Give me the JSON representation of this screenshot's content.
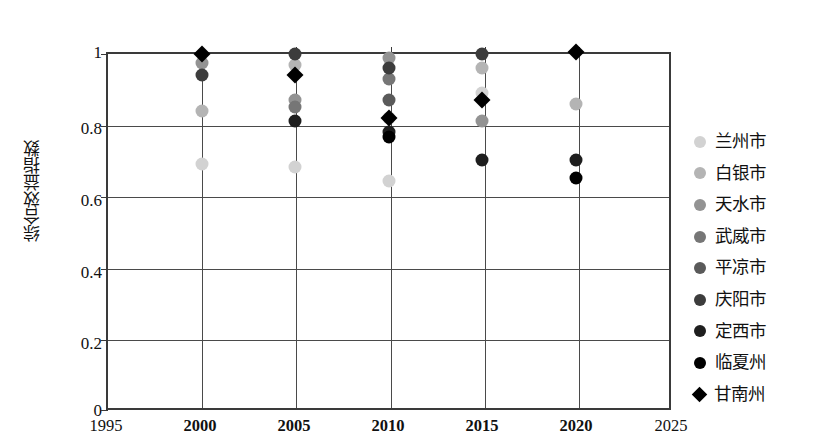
{
  "chart_data": {
    "type": "scatter",
    "title": "",
    "xlabel": "",
    "ylabel": "综合效益指数",
    "xlim": [
      1995,
      2025
    ],
    "ylim": [
      0,
      1
    ],
    "xticks": [
      1995,
      2000,
      2005,
      2010,
      2015,
      2020,
      2025
    ],
    "xticklabels": [
      "1995",
      "2000",
      "2005",
      "2010",
      "2015",
      "2020",
      "2025"
    ],
    "yticks": [
      0,
      0.2,
      0.4,
      0.6,
      0.8,
      1
    ],
    "yticklabels": [
      "0",
      "0.2",
      "0.4",
      "0.6",
      "0.8",
      "1"
    ],
    "grid": "horizontal-and-vertical",
    "legend_position": "right",
    "x": [
      2000,
      2005,
      2010,
      2015,
      2020
    ],
    "series": [
      {
        "name": "兰州市",
        "marker": "circle",
        "color": "#d2d2d2",
        "values": [
          0.69,
          0.68,
          0.64,
          0.89,
          null
        ]
      },
      {
        "name": "白银市",
        "marker": "circle",
        "color": "#b4b4b4",
        "values": [
          0.84,
          0.97,
          0.82,
          0.96,
          0.86
        ]
      },
      {
        "name": "天水市",
        "marker": "circle",
        "color": "#939393",
        "values": [
          0.975,
          0.87,
          0.99,
          0.81,
          null
        ]
      },
      {
        "name": "武威市",
        "marker": "circle",
        "color": "#767676",
        "values": [
          null,
          0.85,
          0.93,
          null,
          null
        ]
      },
      {
        "name": "平凉市",
        "marker": "circle",
        "color": "#5a5a5a",
        "values": [
          null,
          null,
          0.87,
          null,
          null
        ]
      },
      {
        "name": "庆阳市",
        "marker": "circle",
        "color": "#3c3c3c",
        "values": [
          0.94,
          1.0,
          0.96,
          1.0,
          null
        ]
      },
      {
        "name": "定西市",
        "marker": "circle",
        "color": "#1e1e1e",
        "values": [
          null,
          0.81,
          0.78,
          0.7,
          0.7
        ]
      },
      {
        "name": "临夏州",
        "marker": "circle",
        "color": "#000000",
        "values": [
          null,
          null,
          0.765,
          null,
          0.65
        ]
      },
      {
        "name": "甘南州",
        "marker": "diamond",
        "color": "#000000",
        "values": [
          1.0,
          0.94,
          0.82,
          0.87,
          1.005
        ]
      }
    ]
  }
}
